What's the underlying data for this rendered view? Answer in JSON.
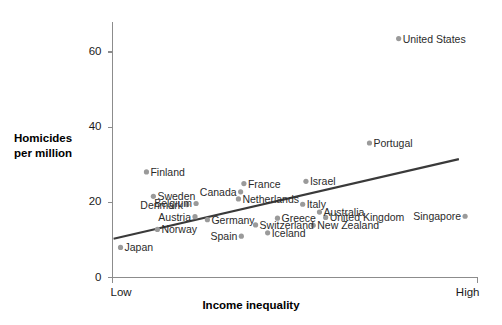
{
  "chart_data": {
    "type": "scatter",
    "title": "",
    "xlabel": "Income inequality",
    "ylabel": "Homicides per million",
    "ylabel_line1": "Homicides",
    "ylabel_line2": "per million",
    "xtick_labels": [
      "Low",
      "High"
    ],
    "ytick_labels": [
      "0",
      "20",
      "40",
      "60"
    ],
    "yticks": [
      0,
      20,
      40,
      60
    ],
    "ylim": [
      0,
      68
    ],
    "xlim": [
      0,
      100
    ],
    "grid": false,
    "legend": false,
    "accent_color": "#9a9a9a",
    "trend_color": "#3a3a3a",
    "axis_color": "#8c8c8c",
    "trendline": {
      "x0": 0.3,
      "y0": 10.3,
      "x1": 94.9,
      "y1": 31.5
    },
    "points": [
      {
        "name": "United States",
        "x": 78.4,
        "y": 63.6,
        "label_pos": "right"
      },
      {
        "name": "Portugal",
        "x": 70.4,
        "y": 35.8,
        "label_pos": "right"
      },
      {
        "name": "Finland",
        "x": 9.3,
        "y": 28.1,
        "label_pos": "right"
      },
      {
        "name": "Israel",
        "x": 53.0,
        "y": 25.6,
        "label_pos": "right"
      },
      {
        "name": "Sweden",
        "x": 11.2,
        "y": 21.6,
        "label_pos": "right"
      },
      {
        "name": "France",
        "x": 36.0,
        "y": 25.0,
        "label_pos": "right"
      },
      {
        "name": "Italy",
        "x": 52.1,
        "y": 19.5,
        "label_pos": "right"
      },
      {
        "name": "Canada",
        "x": 35.1,
        "y": 22.8,
        "label_pos": "left"
      },
      {
        "name": "Netherlands",
        "x": 34.5,
        "y": 20.9,
        "label_pos": "right"
      },
      {
        "name": "Belgium",
        "x": 22.9,
        "y": 19.7,
        "label_pos": "left"
      },
      {
        "name": "Denmark",
        "x": 20.4,
        "y": 19.4,
        "label_pos": "left"
      },
      {
        "name": "Australia",
        "x": 56.7,
        "y": 17.4,
        "label_pos": "right"
      },
      {
        "name": "Greece",
        "x": 45.2,
        "y": 15.8,
        "label_pos": "right"
      },
      {
        "name": "United Kingdom",
        "x": 58.4,
        "y": 16.0,
        "label_pos": "right"
      },
      {
        "name": "Germany",
        "x": 26.0,
        "y": 15.4,
        "label_pos": "right"
      },
      {
        "name": "Austria",
        "x": 22.6,
        "y": 16.2,
        "label_pos": "left"
      },
      {
        "name": "Switzerland",
        "x": 39.2,
        "y": 14.0,
        "label_pos": "right"
      },
      {
        "name": "New Zealand",
        "x": 55.0,
        "y": 13.9,
        "label_pos": "right"
      },
      {
        "name": "Singapore",
        "x": 96.6,
        "y": 16.3,
        "label_pos": "left"
      },
      {
        "name": "Norway",
        "x": 12.3,
        "y": 12.8,
        "label_pos": "right"
      },
      {
        "name": "Spain",
        "x": 35.3,
        "y": 11.0,
        "label_pos": "left"
      },
      {
        "name": "Iceland",
        "x": 42.5,
        "y": 11.9,
        "label_pos": "right"
      },
      {
        "name": "Japan",
        "x": 2.2,
        "y": 8.0,
        "label_pos": "right"
      }
    ]
  }
}
